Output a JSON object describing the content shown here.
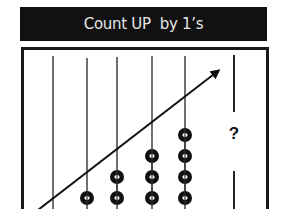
{
  "title": "Count UP  by 1’s",
  "diagram": {
    "type": "abacus-counting-pattern",
    "rods": [
      {
        "index": 1,
        "x": 53,
        "beads": 0
      },
      {
        "index": 2,
        "x": 87,
        "beads": 1
      },
      {
        "index": 3,
        "x": 117,
        "beads": 2
      },
      {
        "index": 4,
        "x": 152,
        "beads": 3
      },
      {
        "index": 5,
        "x": 185,
        "beads": 4
      },
      {
        "index": 6,
        "x": 234,
        "beads": null,
        "unknown": true
      }
    ],
    "unknown_label": "?",
    "arrow": {
      "direction": "up-right",
      "meaning": "count-up"
    },
    "colors": {
      "title_bg": "#111111",
      "title_text": "#e6e6e6",
      "ink": "#111111",
      "background": "#ffffff"
    }
  }
}
